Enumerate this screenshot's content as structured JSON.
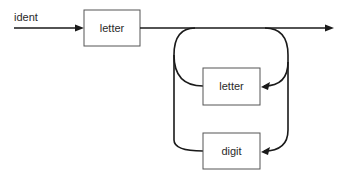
{
  "diagram": {
    "type": "syntax-diagram",
    "rule_name": "ident",
    "nodes": [
      {
        "id": "letter_first",
        "label": "letter",
        "kind": "terminal-box"
      },
      {
        "id": "letter_loop",
        "label": "letter",
        "kind": "terminal-box"
      },
      {
        "id": "digit_loop",
        "label": "digit",
        "kind": "terminal-box"
      }
    ],
    "edges": [
      {
        "from": "start",
        "to": "letter_first"
      },
      {
        "from": "letter_first",
        "to": "end"
      },
      {
        "from": "main_line",
        "to": "letter_loop",
        "kind": "loop-back"
      },
      {
        "from": "main_line",
        "to": "digit_loop",
        "kind": "loop-back"
      }
    ],
    "colors": {
      "line": "#1a1a1a",
      "box_border": "#555555",
      "background": "#ffffff"
    }
  }
}
